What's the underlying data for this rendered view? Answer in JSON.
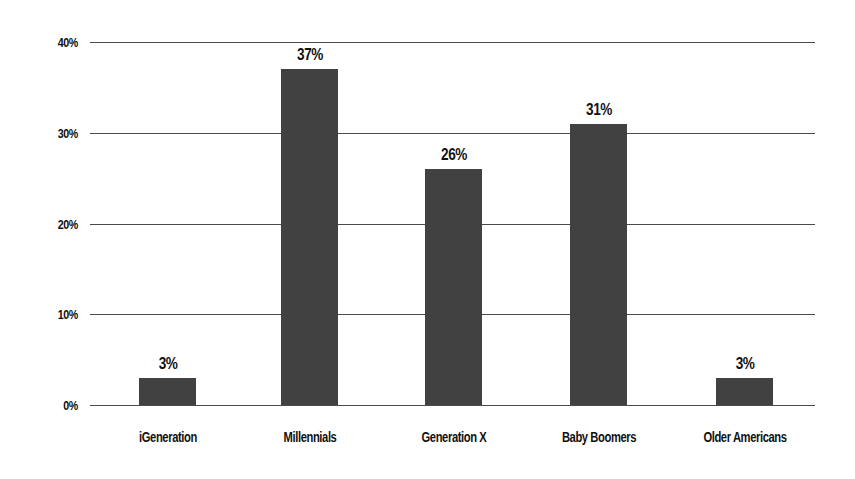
{
  "chart_data": {
    "type": "bar",
    "title": "",
    "subtitle": "",
    "xlabel": "",
    "ylabel": "",
    "categories": [
      "iGeneration",
      "Millennials",
      "Generation X",
      "Baby Boomers",
      "Older Americans"
    ],
    "values": [
      3,
      37,
      26,
      31,
      3
    ],
    "value_labels": [
      "3%",
      "37%",
      "26%",
      "31%",
      "3%"
    ],
    "ylim": [
      0,
      40
    ],
    "yticks": [
      0,
      10,
      20,
      30,
      40
    ],
    "ytick_labels": [
      "0%",
      "10%",
      "20%",
      "30%",
      "40%"
    ],
    "grid": true,
    "legend": false,
    "legend_position": "none",
    "series": [
      {
        "name": "Share of respondents",
        "values": [
          3,
          37,
          26,
          31,
          3
        ],
        "color": "#414141"
      }
    ],
    "colors": {
      "bar_fill": "#414141",
      "gridline": "#4b4b4b",
      "axis_text": "#111111",
      "background": "#ffffff"
    }
  }
}
